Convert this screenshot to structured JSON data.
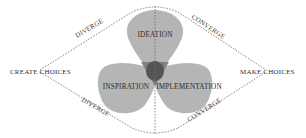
{
  "diagram": {
    "type": "design-thinking-process",
    "endpoints": {
      "left": "CREATE CHOICES",
      "right": "MAKE CHOICES"
    },
    "edges": {
      "top_left": "DIVERGE",
      "top_right": "CONVERGE",
      "bottom_left": "DIVERGE",
      "bottom_right": "CONVERGE"
    },
    "petals": [
      {
        "id": "ideation",
        "label": "IDEATION",
        "position": "top"
      },
      {
        "id": "inspiration",
        "label": "INSPIRATION",
        "position": "bottom-left"
      },
      {
        "id": "implementation",
        "label": "IMPLEMENTATION",
        "position": "bottom-right"
      }
    ],
    "colors": {
      "petal_fill": "#a8a8a8",
      "overlap_fill": "#6b6b6b",
      "center_fill": "#4a4a4a",
      "dash_line": "#6f6f6f",
      "text": "#2f2f2f",
      "background": "#ffffff"
    }
  }
}
